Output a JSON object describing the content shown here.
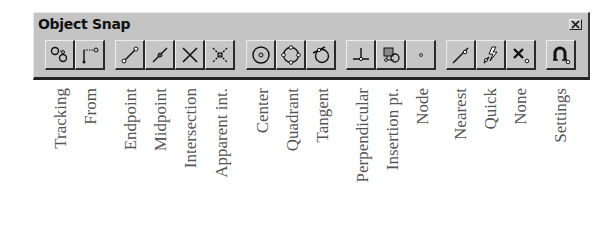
{
  "toolbar": {
    "title": "Object Snap",
    "close_icon": "close-icon",
    "background": "#c4c4c4",
    "buttons": [
      {
        "id": "tracking",
        "icon": "tracking-icon",
        "label": "Tracking"
      },
      {
        "id": "from",
        "icon": "from-icon",
        "label": "From"
      },
      {
        "id": "endpoint",
        "icon": "endpoint-icon",
        "label": "Endpoint"
      },
      {
        "id": "midpoint",
        "icon": "midpoint-icon",
        "label": "Midpoint"
      },
      {
        "id": "intersection",
        "icon": "intersection-icon",
        "label": "Intersection"
      },
      {
        "id": "apparent-int",
        "icon": "apparent-intersection-icon",
        "label": "Apparent int."
      },
      {
        "id": "center",
        "icon": "center-icon",
        "label": "Center"
      },
      {
        "id": "quadrant",
        "icon": "quadrant-icon",
        "label": "Quadrant"
      },
      {
        "id": "tangent",
        "icon": "tangent-icon",
        "label": "Tangent"
      },
      {
        "id": "perpendicular",
        "icon": "perpendicular-icon",
        "label": "Perpendicular"
      },
      {
        "id": "insertion-pt",
        "icon": "insertion-icon",
        "label": "Insertion pt."
      },
      {
        "id": "node",
        "icon": "node-icon",
        "label": "Node"
      },
      {
        "id": "nearest",
        "icon": "nearest-icon",
        "label": "Nearest"
      },
      {
        "id": "quick",
        "icon": "quick-icon",
        "label": "Quick"
      },
      {
        "id": "none",
        "icon": "none-icon",
        "label": "None"
      },
      {
        "id": "settings",
        "icon": "settings-magnet-icon",
        "label": "Settings"
      }
    ]
  }
}
